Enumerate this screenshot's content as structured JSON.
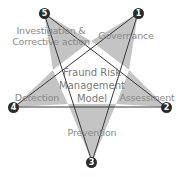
{
  "diagram": {
    "title": "Fraund Risk Management Model",
    "center_lines": [
      "Fraund Risk",
      "Management",
      "Model"
    ],
    "colors": {
      "point_fill": "#c4c4c4",
      "center_fill": "#ffffff",
      "stroke": "#3a3a3a",
      "label_text": "#8a8a8a",
      "badge_fill": "#2b2b2b",
      "badge_text": "#ffffff"
    },
    "points": [
      {
        "number": "1",
        "label": "Governance"
      },
      {
        "number": "2",
        "label": "Assessment"
      },
      {
        "number": "3",
        "label": "Prevention"
      },
      {
        "number": "4",
        "label": "Detection"
      },
      {
        "number": "5",
        "label_lines": [
          "Investigation &",
          "Corrective action"
        ]
      }
    ]
  }
}
